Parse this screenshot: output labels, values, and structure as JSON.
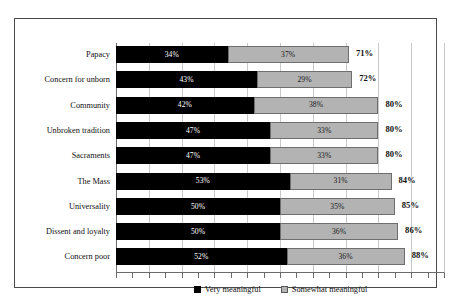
{
  "chart_data": {
    "type": "bar",
    "orientation": "horizontal",
    "stacked": true,
    "title": "",
    "subtitle": "",
    "xlabel": "",
    "ylabel": "",
    "xlim": [
      0,
      100
    ],
    "grid": true,
    "gridline_step": 10,
    "legend_position": "bottom",
    "categories": [
      "Papacy",
      "Concern for unborn",
      "Community",
      "Unbroken tradition",
      "Sacraments",
      "The Mass",
      "Universality",
      "Dissent and loyalty",
      "Concern poor"
    ],
    "series": [
      {
        "name": "Very meaningful",
        "color": "#000000",
        "values": [
          34,
          43,
          42,
          47,
          47,
          53,
          50,
          50,
          52
        ],
        "labels": [
          "34%",
          "43%",
          "42%",
          "47%",
          "47%",
          "53%",
          "50%",
          "50%",
          "52%"
        ]
      },
      {
        "name": "Somewhat meaningful",
        "color": "#b3b3b3",
        "values": [
          37,
          29,
          38,
          33,
          33,
          31,
          35,
          36,
          36
        ],
        "labels": [
          "37%",
          "29%",
          "38%",
          "33%",
          "33%",
          "31%",
          "35%",
          "36%",
          "36%"
        ]
      }
    ],
    "totals": [
      71,
      72,
      80,
      80,
      80,
      84,
      85,
      86,
      88
    ],
    "total_labels": [
      "71%",
      "72%",
      "80%",
      "80%",
      "80%",
      "84%",
      "85%",
      "86%",
      "88%"
    ]
  },
  "legend": {
    "items": [
      {
        "label": "Very meaningful",
        "swatch": "black-square-icon"
      },
      {
        "label": "Somewhat meaningful",
        "swatch": "gray-square-icon"
      }
    ]
  }
}
